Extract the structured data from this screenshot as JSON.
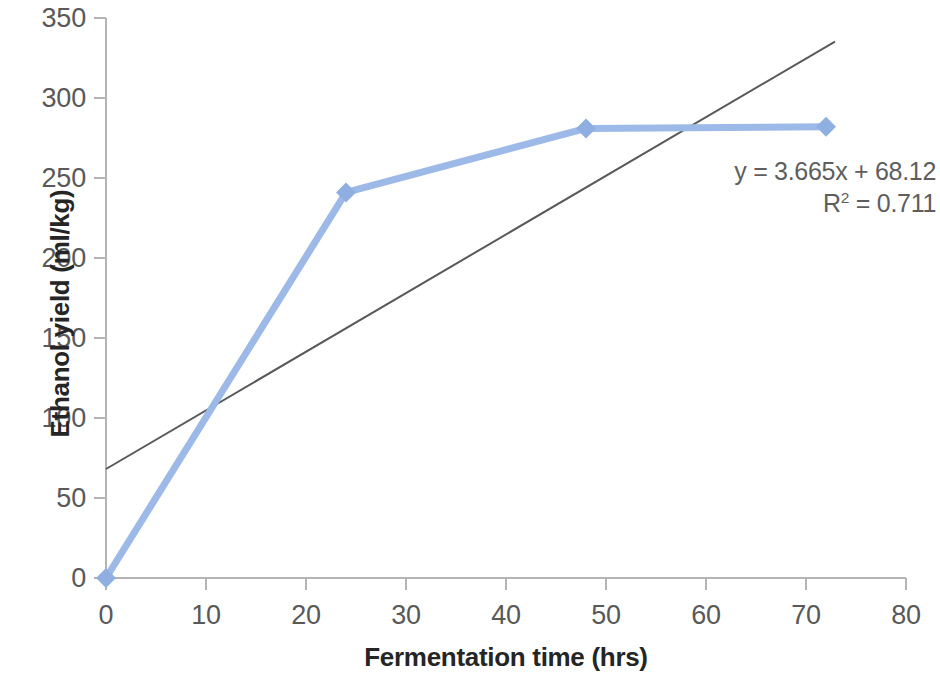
{
  "chart_data": {
    "type": "line",
    "title": "",
    "xlabel": "Fermentation time (hrs)",
    "ylabel": "Ethanol yield (ml/kg)",
    "xlim": [
      0,
      80
    ],
    "ylim": [
      0,
      350
    ],
    "xticks": [
      0,
      10,
      20,
      30,
      40,
      50,
      60,
      70,
      80
    ],
    "yticks": [
      0,
      50,
      100,
      150,
      200,
      250,
      300,
      350
    ],
    "grid": false,
    "legend": "none",
    "series": [
      {
        "name": "Ethanol yield",
        "color": "#9DB9E8",
        "marker": "diamond",
        "x": [
          0,
          24,
          48,
          72
        ],
        "y": [
          0,
          241,
          281,
          282
        ]
      }
    ],
    "trendline": {
      "type": "linear",
      "color": "#595959",
      "equation": "y = 3.665x + 68.12",
      "r_squared_label": "R",
      "r_squared_exponent": "2",
      "r_squared_value": "= 0.711",
      "slope": 3.665,
      "intercept": 68.12,
      "r2": 0.711,
      "x_start": 0,
      "x_end": 72.9
    },
    "annotations": [
      {
        "text": "y = 3.665x + 68.12"
      },
      {
        "text": "R² = 0.711"
      }
    ],
    "xtick_labels": [
      "0",
      "10",
      "20",
      "30",
      "40",
      "50",
      "60",
      "70",
      "80"
    ],
    "ytick_labels": [
      "0",
      "50",
      "100",
      "150",
      "200",
      "250",
      "300",
      "350"
    ],
    "axis_color": "#b0b0b0",
    "tick_label_color": "#595959",
    "axis_title_color": "#252525"
  }
}
